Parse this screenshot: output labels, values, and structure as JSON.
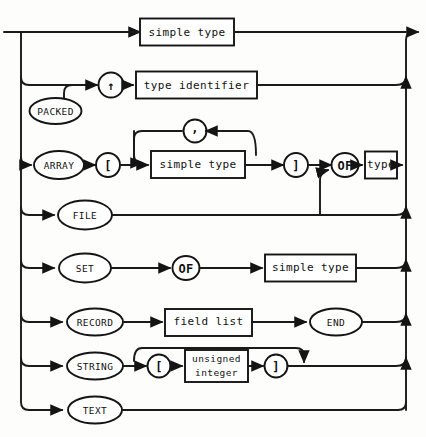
{
  "diagram": {
    "title": "type",
    "kind": "railroad-syntax-diagram",
    "colors": {
      "ink": "#141414",
      "paper": "#fdfdfc"
    },
    "entry_label": "",
    "exit_label": "",
    "alternatives": [
      {
        "id": "alt-simple-type",
        "row": 1,
        "nodes": [
          {
            "id": "n-simple-type-1",
            "shape": "box",
            "text": "simple type",
            "kind": "nonterminal"
          }
        ]
      },
      {
        "id": "alt-pointer-type",
        "row": 2,
        "nodes": [
          {
            "id": "n-caret",
            "shape": "circle",
            "text": "↑",
            "kind": "terminal"
          },
          {
            "id": "n-type-identifier",
            "shape": "box",
            "text": "type identifier",
            "kind": "nonterminal"
          }
        ]
      },
      {
        "id": "alt-packed",
        "row": 3,
        "nodes": [
          {
            "id": "n-packed",
            "shape": "oval",
            "text": "PACKED",
            "kind": "terminal"
          }
        ]
      },
      {
        "id": "alt-array",
        "row": 4,
        "nodes": [
          {
            "id": "n-array",
            "shape": "oval",
            "text": "ARRAY",
            "kind": "terminal"
          },
          {
            "id": "n-lbracket-array",
            "shape": "circle",
            "text": "[",
            "kind": "terminal"
          },
          {
            "id": "n-simple-type-2",
            "shape": "box",
            "text": "simple type",
            "kind": "nonterminal"
          },
          {
            "id": "n-comma",
            "shape": "circle",
            "text": ",",
            "kind": "terminal"
          },
          {
            "id": "n-rbracket-array",
            "shape": "circle",
            "text": "]",
            "kind": "terminal"
          },
          {
            "id": "n-of-array",
            "shape": "oval",
            "text": "OF",
            "kind": "terminal"
          },
          {
            "id": "n-type",
            "shape": "box",
            "text": "type",
            "kind": "nonterminal"
          }
        ]
      },
      {
        "id": "alt-file",
        "row": 5,
        "nodes": [
          {
            "id": "n-file",
            "shape": "oval",
            "text": "FILE",
            "kind": "terminal"
          }
        ]
      },
      {
        "id": "alt-set",
        "row": 6,
        "nodes": [
          {
            "id": "n-set",
            "shape": "oval",
            "text": "SET",
            "kind": "terminal"
          },
          {
            "id": "n-of-set",
            "shape": "oval",
            "text": "OF",
            "kind": "terminal"
          },
          {
            "id": "n-simple-type-3",
            "shape": "box",
            "text": "simple type",
            "kind": "nonterminal"
          }
        ]
      },
      {
        "id": "alt-record",
        "row": 7,
        "nodes": [
          {
            "id": "n-record",
            "shape": "oval",
            "text": "RECORD",
            "kind": "terminal"
          },
          {
            "id": "n-field-list",
            "shape": "box",
            "text": "field list",
            "kind": "nonterminal"
          },
          {
            "id": "n-end",
            "shape": "oval",
            "text": "END",
            "kind": "terminal"
          }
        ]
      },
      {
        "id": "alt-string",
        "row": 8,
        "nodes": [
          {
            "id": "n-string",
            "shape": "oval",
            "text": "STRING",
            "kind": "terminal"
          },
          {
            "id": "n-lbracket-string",
            "shape": "circle",
            "text": "[",
            "kind": "terminal"
          },
          {
            "id": "n-unsigned-integer",
            "shape": "box",
            "text": "unsigned integer",
            "line1": "unsigned",
            "line2": "integer",
            "kind": "nonterminal"
          },
          {
            "id": "n-rbracket-string",
            "shape": "circle",
            "text": "]",
            "kind": "terminal"
          }
        ]
      },
      {
        "id": "alt-text",
        "row": 9,
        "nodes": [
          {
            "id": "n-text",
            "shape": "oval",
            "text": "TEXT",
            "kind": "terminal"
          }
        ]
      }
    ]
  }
}
